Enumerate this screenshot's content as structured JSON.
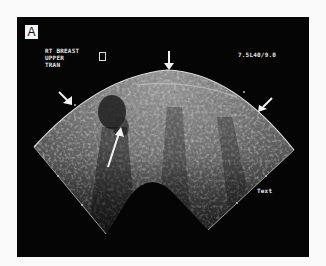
{
  "figure": {
    "panel_label": "A",
    "annotations": {
      "side": "RT BREAST",
      "region": "UPPER",
      "plane": "TRAN",
      "probe_settings": "7.5L40/9.0",
      "text_marker": "Text"
    },
    "arrows": [
      {
        "name": "top-arrow",
        "direction": "down"
      },
      {
        "name": "left-arrow",
        "direction": "down-right"
      },
      {
        "name": "right-arrow",
        "direction": "down-left"
      },
      {
        "name": "lesion-arrow",
        "direction": "up-right"
      }
    ],
    "colors": {
      "background": "#fafafa",
      "panel": "#050505",
      "annotation_text": "#e8e8e8"
    }
  }
}
